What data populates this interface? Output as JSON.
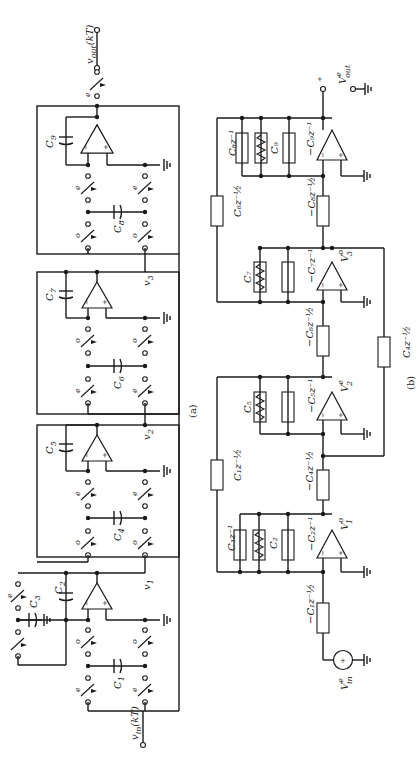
{
  "figure": {
    "orientation": "rotated-90-ccw",
    "panel_a": {
      "caption": "(a)",
      "input_label": "v_in(kT)",
      "output_label": "v_out(kT)",
      "node_labels": [
        "v1",
        "v2",
        "v3"
      ],
      "capacitors": [
        "C1",
        "C2",
        "C3",
        "C4",
        "C5",
        "C6",
        "C7",
        "C8",
        "C9"
      ],
      "switch_phases": [
        "e",
        "o"
      ]
    },
    "panel_b": {
      "caption": "(b)",
      "source_label": "V_in^e",
      "output_label": "V_out^e",
      "node_labels": [
        "V1^o",
        "V2^e",
        "V3^o"
      ],
      "elements": [
        "-C1 z^-1/2",
        "C3 z^-1",
        "C2",
        "-C2 z^-1",
        "C1 z^-1/2",
        "-C4 z^-1/2",
        "C5",
        "-C5 z^-1",
        "-C6 z^-1/2",
        "C4 z^-1/2",
        "C7",
        "-C7 z^-1",
        "C6 z^-1/2",
        "-C8 z^-1/2",
        "C8 z^-1",
        "C9",
        "-C9 z^-1"
      ]
    }
  },
  "labels": {
    "vin": "v",
    "vin_sub": "in",
    "vin_arg": "(kT)",
    "vout": "v",
    "vout_sub": "out",
    "vout_arg": "(kT)",
    "v1": "v",
    "v1_sub": "1",
    "v2": "v",
    "v2_sub": "2",
    "v3": "v",
    "v3_sub": "3",
    "c1": "C",
    "c1_sub": "1",
    "c2": "C",
    "c2_sub": "2",
    "c3": "C",
    "c3_sub": "3",
    "c4": "C",
    "c4_sub": "4",
    "c5": "C",
    "c5_sub": "5",
    "c6": "C",
    "c6_sub": "6",
    "c7": "C",
    "c7_sub": "7",
    "c8": "C",
    "c8_sub": "8",
    "c9": "C",
    "c9_sub": "9",
    "phase_e": "e",
    "phase_o": "o",
    "caption_a": "(a)",
    "caption_b": "(b)",
    "b_vin": "V",
    "b_vin_sup": "e",
    "b_vin_sub": "in",
    "b_vout": "V",
    "b_vout_sup": "e",
    "b_vout_sub": "out",
    "b_v1": "V",
    "b_v1_sup": "o",
    "b_v1_sub": "1",
    "b_v2": "V",
    "b_v2_sup": "e",
    "b_v2_sub": "2",
    "b_v3": "V",
    "b_v3_sup": "o",
    "b_v3_sub": "3",
    "b_m_c1_half": "−C₁z⁻½",
    "b_c3_z1": "C₃z⁻¹",
    "b_c2": "C₂",
    "b_m_c2_z1": "−C₂z⁻¹",
    "b_c1_half": "C₁z⁻½",
    "b_m_c4_half": "−C₄z⁻½",
    "b_c5": "C₅",
    "b_m_c5_z1": "−C₅z⁻¹",
    "b_m_c6_half": "−C₆z⁻½",
    "b_c4_half": "C₄z⁻½",
    "b_c7": "C₇",
    "b_m_c7_z1": "−C₇z⁻¹",
    "b_c6_half": "C₆z⁻½",
    "b_m_c8_half": "−C₈z⁻½",
    "b_c8_z1": "C₈z⁻¹",
    "b_c9": "C₉",
    "b_m_c9_z1": "−C₉z⁻¹",
    "plus": "+",
    "minus": "−"
  }
}
